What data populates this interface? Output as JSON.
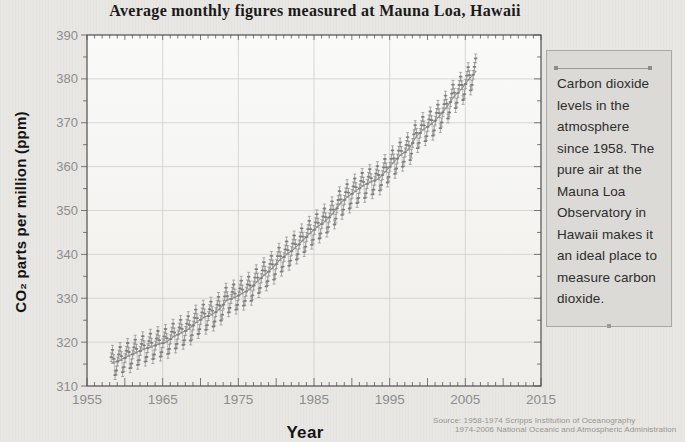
{
  "page": {
    "title": "Average monthly figures measured at Mauna Loa, Hawaii"
  },
  "chart": {
    "y_axis_label": "CO₂ parts per million (ppm)",
    "x_axis_label": "Year"
  },
  "caption_box": {
    "text": "Carbon dioxide levels in the atmosphere since 1958. The pure air at the Mauna Loa Observatory in Hawaii makes it an ideal place to measure carbon dioxide."
  },
  "source": {
    "line1": "Source: 1958-1974 Scripps Institution of Oceanography",
    "line2": "1974-2006 National Oceanic and Atmospheric Administration"
  },
  "chart_data": {
    "type": "line",
    "title": "Average monthly figures measured at Mauna Loa, Hawaii",
    "xlabel": "Year",
    "ylabel": "CO₂ parts per million (ppm)",
    "xlim": [
      1955,
      2015
    ],
    "ylim": [
      310,
      390
    ],
    "x_ticks": [
      1955,
      1965,
      1975,
      1985,
      1995,
      2005,
      2015
    ],
    "y_ticks": [
      310,
      320,
      330,
      340,
      350,
      360,
      370,
      380,
      390
    ],
    "x_minor_step": 1,
    "y_minor_step": 5,
    "grid": true,
    "series": [
      {
        "name": "CO2 monthly average with uncertainty",
        "start_year": 1958,
        "end_year": 2006,
        "annual_means": [
          315.34,
          315.98,
          316.91,
          317.64,
          318.45,
          318.99,
          319.62,
          320.04,
          321.37,
          322.18,
          323.05,
          324.62,
          325.68,
          326.32,
          327.46,
          329.68,
          330.19,
          331.12,
          332.03,
          333.84,
          335.41,
          336.84,
          338.76,
          340.12,
          341.48,
          343.15,
          344.87,
          346.35,
          347.61,
          349.31,
          351.69,
          353.2,
          354.45,
          355.7,
          356.54,
          357.21,
          358.96,
          360.97,
          362.74,
          363.88,
          366.84,
          368.54,
          369.71,
          371.32,
          373.45,
          375.98,
          377.7,
          379.98,
          381.9
        ],
        "seasonal_offsets": [
          -0.1,
          0.65,
          1.4,
          2.55,
          3.0,
          2.35,
          0.8,
          -1.3,
          -3.0,
          -3.25,
          -2.05,
          -0.95
        ],
        "error_ppm": 1.0
      }
    ],
    "colors": {
      "data": "#8d8d8d",
      "trend": "#969696",
      "grid": "#cfcecb",
      "axis": "#4f4f4f",
      "tick": "#6b6b6b",
      "tick_label": "#8d8d8d",
      "plot_bg_top": "#fafaf8",
      "plot_bg_bottom": "#efeeeb"
    }
  }
}
